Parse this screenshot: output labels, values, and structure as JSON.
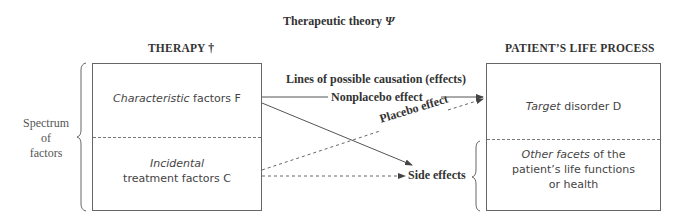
{
  "title": {
    "text": "Therapeutic theory",
    "symbol": "Ψ"
  },
  "left_column": {
    "heading": "THERAPY †",
    "brace_label_lines": [
      "Spectrum",
      "of",
      "factors"
    ],
    "top_box": {
      "italic": "Characteristic",
      "rest": " factors F"
    },
    "bottom_box": {
      "italic": "Incidental",
      "rest": "treatment factors C"
    }
  },
  "right_column": {
    "heading": "PATIENT’S LIFE PROCESS",
    "top_box": {
      "italic": "Target",
      "rest": " disorder D"
    },
    "bottom_box": {
      "italic": "Other facets",
      "rest": " of the",
      "line2": "patient’s life functions",
      "line3": "or health"
    }
  },
  "center": {
    "lines_heading": "Lines of possible causation (effects)",
    "nonplacebo_label": "Nonplacebo effect",
    "placebo_label": "Placebo effect",
    "side_effects_label": "Side effects"
  },
  "colors": {
    "line": "#555555",
    "text": "#333333",
    "box_border": "#666666"
  }
}
